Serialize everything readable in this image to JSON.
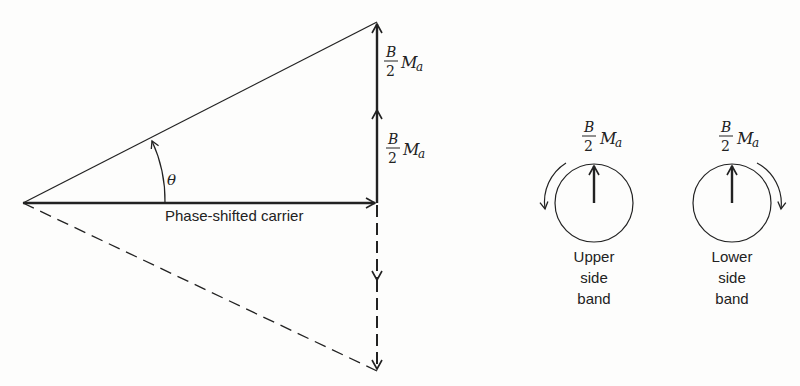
{
  "diagram": {
    "type": "phasor-diagram",
    "left_panel": {
      "carrier_label": "Phase-shifted carrier",
      "angle_label": "θ",
      "upper_vector_label": {
        "numerator": "B",
        "denominator": "2",
        "symbol": "M",
        "subscript": "a"
      },
      "lower_vector_label": {
        "numerator": "B",
        "denominator": "2",
        "symbol": "M",
        "subscript": "a"
      }
    },
    "right_panel": {
      "upper_sideband": {
        "label_lines": [
          "Upper",
          "side",
          "band"
        ],
        "magnitude": {
          "numerator": "B",
          "denominator": "2",
          "symbol": "M",
          "subscript": "a"
        },
        "rotation": "counterclockwise"
      },
      "lower_sideband": {
        "label_lines": [
          "Lower",
          "side",
          "band"
        ],
        "magnitude": {
          "numerator": "B",
          "denominator": "2",
          "symbol": "M",
          "subscript": "a"
        },
        "rotation": "clockwise"
      }
    },
    "colors": {
      "ink": "#222222",
      "background": "#fdfdfc"
    }
  }
}
